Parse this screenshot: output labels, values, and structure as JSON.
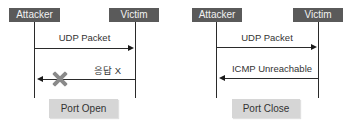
{
  "diagrams": [
    {
      "actors": {
        "left": "Attacker",
        "right": "Victim"
      },
      "messages": [
        {
          "label": "UDP Packet",
          "direction": "attacker-to-victim"
        },
        {
          "label": "응답 X",
          "direction": "victim-to-attacker",
          "blocked": true,
          "icon": "x-mark-icon"
        }
      ],
      "result": "Port Open"
    },
    {
      "actors": {
        "left": "Attacker",
        "right": "Victim"
      },
      "messages": [
        {
          "label": "UDP Packet",
          "direction": "attacker-to-victim"
        },
        {
          "label": "ICMP Unreachable",
          "direction": "victim-to-attacker",
          "blocked": false
        }
      ],
      "result": "Port Close"
    }
  ],
  "colors": {
    "actor_bg": "#5a5a5a",
    "actor_text": "#f2f2f2",
    "line": "#2a2a2a",
    "result_bg": "#d6d6d6",
    "x_mark": "#8a8a8a"
  }
}
